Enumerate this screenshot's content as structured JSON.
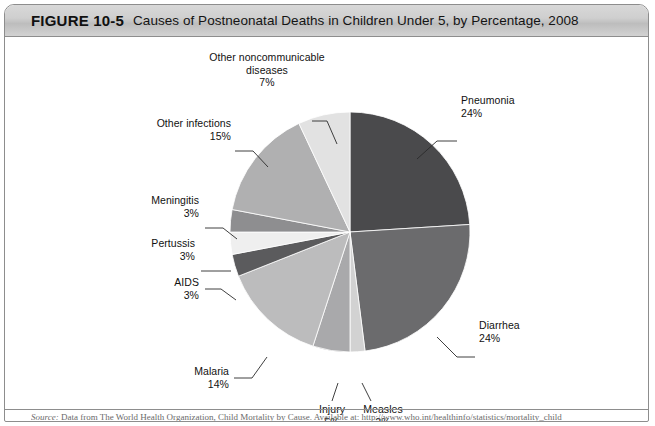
{
  "figure": {
    "number_label": "FIGURE 10-5",
    "title": "Causes of Postneonatal Deaths in Children Under 5, by Percentage, 2008",
    "source_label": "Source:",
    "source_text": "Data from The World Health Organization, Child Mortality by Cause. Available at: http://www.who.int/healthinfo/statistics/mortality_child"
  },
  "chart_data": {
    "type": "pie",
    "title": "Causes of Postneonatal Deaths in Children Under 5, by Percentage, 2008",
    "unit": "percent",
    "start_angle_deg": 0,
    "direction": "clockwise",
    "legend": "none (direct labels with leader lines)",
    "categories": [
      "Pneumonia",
      "Diarrhea",
      "Measles",
      "Injury",
      "Malaria",
      "AIDS",
      "Pertussis",
      "Meningitis",
      "Other infections",
      "Other noncommunicable diseases"
    ],
    "values": [
      24,
      24,
      2,
      5,
      14,
      3,
      3,
      3,
      15,
      7
    ],
    "slices": [
      {
        "label": "Pneumonia",
        "value": 24,
        "pct_text": "24%",
        "color": "#4a4a4c"
      },
      {
        "label": "Diarrhea",
        "value": 24,
        "pct_text": "24%",
        "color": "#6b6b6d"
      },
      {
        "label": "Measles",
        "value": 2,
        "pct_text": "2%",
        "color": "#d2d2d2"
      },
      {
        "label": "Injury",
        "value": 5,
        "pct_text": "5%",
        "color": "#a9a9ab"
      },
      {
        "label": "Malaria",
        "value": 14,
        "pct_text": "14%",
        "color": "#bcbcbd"
      },
      {
        "label": "AIDS",
        "value": 3,
        "pct_text": "3%",
        "color": "#5b5b5d"
      },
      {
        "label": "Pertussis",
        "value": 3,
        "pct_text": "3%",
        "color": "#efefef"
      },
      {
        "label": "Meningitis",
        "value": 3,
        "pct_text": "3%",
        "color": "#8e8e90"
      },
      {
        "label": "Other infections",
        "value": 15,
        "pct_text": "15%",
        "color": "#b0b0b1"
      },
      {
        "label": "Other noncommunicable diseases",
        "value": 7,
        "pct_text": "7%",
        "color": "#e2e2e2"
      }
    ]
  },
  "labels": {
    "pneumonia": {
      "name": "Pneumonia",
      "pct": "24%"
    },
    "diarrhea": {
      "name": "Diarrhea",
      "pct": "24%"
    },
    "measles": {
      "name": "Measles",
      "pct": "2%"
    },
    "injury": {
      "name": "Injury",
      "pct": "5%"
    },
    "malaria": {
      "name": "Malaria",
      "pct": "14%"
    },
    "aids": {
      "name": "AIDS",
      "pct": "3%"
    },
    "pertussis": {
      "name": "Pertussis",
      "pct": "3%"
    },
    "meningitis": {
      "name": "Meningitis",
      "pct": "3%"
    },
    "other_infections": {
      "name": "Other infections",
      "pct": "15%"
    },
    "other_noncommunicable": {
      "line1": "Other noncommunicable",
      "line2": "diseases",
      "pct": "7%"
    }
  }
}
